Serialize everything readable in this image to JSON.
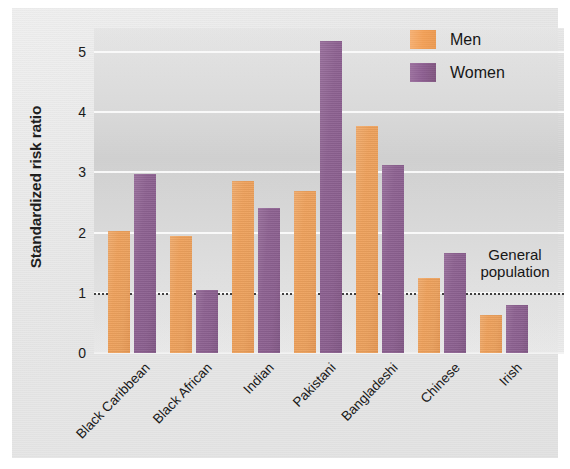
{
  "chart_data": {
    "type": "bar",
    "title": "",
    "xlabel": "",
    "ylabel": "Standardized risk ratio",
    "ylim": [
      0,
      5.4
    ],
    "yticks": [
      "0",
      "1",
      "2",
      "3",
      "4",
      "5"
    ],
    "grid": true,
    "legend_position": "top-right",
    "categories": [
      "Black Caribbean",
      "Black African",
      "Indian",
      "Pakistani",
      "Bangladeshi",
      "Chinese",
      "Irish"
    ],
    "series": [
      {
        "name": "Men",
        "color": "#f3a158",
        "values": [
          2.02,
          1.95,
          2.85,
          2.7,
          3.78,
          1.25,
          0.63
        ]
      },
      {
        "name": "Women",
        "color": "#8d5f91",
        "values": [
          2.98,
          1.05,
          2.41,
          5.18,
          3.13,
          1.67,
          0.8
        ]
      }
    ],
    "annotations": [
      {
        "name": "general-population-reference",
        "value": 1.0,
        "label_line1": "General",
        "label_line2": "population",
        "style": "dotted"
      }
    ]
  },
  "legend": {
    "items": [
      {
        "label": "Men"
      },
      {
        "label": "Women"
      }
    ]
  },
  "annotation": {
    "line1": "General",
    "line2": "population"
  }
}
